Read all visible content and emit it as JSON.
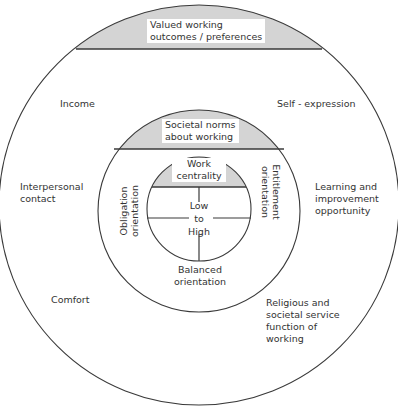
{
  "colors": {
    "line": "#3a3a3a",
    "shade": "#d4d4d4",
    "background": "#ffffff"
  },
  "outer_ring": {
    "title_line1": "Valued working",
    "title_line2": "outcomes / preferences",
    "items": {
      "income": "Income",
      "self_expression": "Self - expression",
      "interpersonal_line1": "Interpersonal",
      "interpersonal_line2": "contact",
      "learning_line1": "Learning and",
      "learning_line2": "improvement",
      "learning_line3": "opportunity",
      "comfort": "Comfort",
      "religious_line1": "Religious and",
      "religious_line2": "societal service",
      "religious_line3": "function of",
      "religious_line4": "working"
    }
  },
  "middle_ring": {
    "title_line1": "Societal norms",
    "title_line2": "about working",
    "left_line1": "Obligation",
    "left_line2": "orientation",
    "right_line1": "Entitlement",
    "right_line2": "orientation",
    "bottom_line1": "Balanced",
    "bottom_line2": "orientation"
  },
  "inner_circle": {
    "title_line1": "Work",
    "title_line2": "centrality",
    "scale_line1": "Low",
    "scale_line2": "to",
    "scale_line3": "High"
  }
}
